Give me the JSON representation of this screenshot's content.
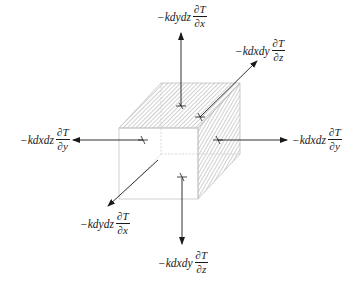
{
  "diagram": {
    "labels": {
      "top": {
        "coef": "−kdydz",
        "num": "∂T",
        "den": "∂x"
      },
      "back": {
        "coef": "−kdxdy",
        "num": "∂T",
        "den": "∂z"
      },
      "left": {
        "coef": "−kdxdz",
        "num": "∂T",
        "den": "∂y"
      },
      "right": {
        "coef": "−kdxdz",
        "num": "∂T",
        "den": "∂y"
      },
      "front": {
        "coef": "−kdydz",
        "num": "∂T",
        "den": "∂x"
      },
      "bottom": {
        "coef": "−kdxdy",
        "num": "∂T",
        "den": "∂z"
      }
    },
    "colors": {
      "line": "#1a1a1a",
      "cube_edge": "#b8b8b8",
      "hatch": "#8a8a8a"
    }
  }
}
